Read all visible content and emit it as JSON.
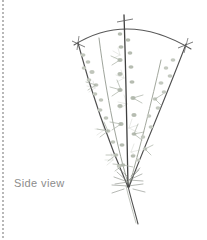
{
  "figure": {
    "caption": "Side view",
    "caption_color": "#8c8c8c",
    "background_color": "#ffffff",
    "edge_rule_color": "#b8b8b8",
    "cane_color_dark": "#4a4a4a",
    "cane_color_mid": "#6e6e6e",
    "cane_color_light": "#a9aea4",
    "foliage_color": "#b9bfb4",
    "foliage_color_light": "#cfd4cb",
    "support_arc_color": "#555555",
    "crown": {
      "x": 128,
      "y": 187
    },
    "arc": {
      "left_x": 74,
      "left_y": 45,
      "peak_x": 128,
      "peak_y": 22,
      "right_x": 191,
      "right_y": 49
    },
    "canes": [
      {
        "name": "left-outer-cane",
        "tip_x": 78,
        "tip_y": 43,
        "tied": true
      },
      {
        "name": "left-inner-cane",
        "tip_x": 99,
        "tip_y": 37,
        "tied": false
      },
      {
        "name": "center-cane",
        "tip_x": 124,
        "tip_y": 15,
        "tied": true
      },
      {
        "name": "right-inner-cane",
        "tip_x": 160,
        "tip_y": 60,
        "tied": false
      },
      {
        "name": "right-outer-cane",
        "tip_x": 186,
        "tip_y": 44,
        "tied": true
      }
    ],
    "root_stem": {
      "from_x": 128,
      "from_y": 187,
      "to_x": 138,
      "to_y": 224
    }
  }
}
